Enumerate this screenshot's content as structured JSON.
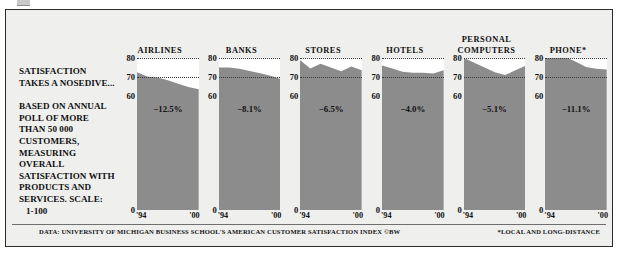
{
  "caption": {
    "lede": "SATISFACTION TAKES A NOSEDIVE...",
    "body": "BASED ON ANNUAL POLL OF MORE THAN 50 000 CUSTOMERS, MEASURING OVERALL SATISFACTION WITH PRODUCTS AND SERVICES. SCALE:",
    "scale": "1-100"
  },
  "footer": {
    "source": "DATA: UNIVERSITY OF MICHIGAN BUSINESS SCHOOL'S AMERICAN CUSTOMER SATISFACTION INDEX ©BW",
    "note": "*LOCAL AND LONG-DISTANCE"
  },
  "colors": {
    "fill": "#8c8c8c",
    "plot_background": "#ffffff",
    "panel_background": "#efefee",
    "text": "#111111",
    "frame": "#2b2b2b"
  },
  "chart_data": {
    "type": "area",
    "title": "SATISFACTION TAKES A NOSEDIVE...",
    "xlabel": "",
    "ylabel": "",
    "ylim": [
      0,
      80
    ],
    "yticks": [
      80,
      70,
      60,
      0
    ],
    "xticks": [
      "'94",
      "'00"
    ],
    "x": [
      1994,
      1995,
      1996,
      1997,
      1998,
      1999,
      2000
    ],
    "grid": true,
    "gridlines_at": [
      80,
      70
    ],
    "legend": "none",
    "series": [
      {
        "name": "AIRLINES",
        "change_label": "−12.5%",
        "change_pct": -12.5,
        "values": [
          72.5,
          70.2,
          69.8,
          68.3,
          66.5,
          64.8,
          63.5
        ]
      },
      {
        "name": "BANKS",
        "change_label": "−8.1%",
        "change_pct": -8.1,
        "values": [
          75.0,
          75.0,
          74.3,
          73.1,
          72.0,
          70.6,
          69.0
        ]
      },
      {
        "name": "STORES",
        "change_label": "−6.5%",
        "change_pct": -6.5,
        "values": [
          79.0,
          74.5,
          77.0,
          75.0,
          73.0,
          75.5,
          73.5
        ]
      },
      {
        "name": "HOTELS",
        "change_label": "−4.0%",
        "change_pct": -4.0,
        "values": [
          76.0,
          74.5,
          72.8,
          72.2,
          72.2,
          71.8,
          73.5
        ]
      },
      {
        "name": "PERSONAL\nCOMPUTERS",
        "change_label": "−5.1%",
        "change_pct": -5.1,
        "values": [
          80.0,
          77.5,
          75.0,
          72.5,
          71.0,
          73.5,
          76.0
        ]
      },
      {
        "name": "PHONE*",
        "change_label": "−11.1%",
        "change_pct": -11.1,
        "values": [
          81.0,
          81.0,
          80.5,
          78.0,
          75.2,
          74.4,
          74.0
        ]
      }
    ]
  }
}
